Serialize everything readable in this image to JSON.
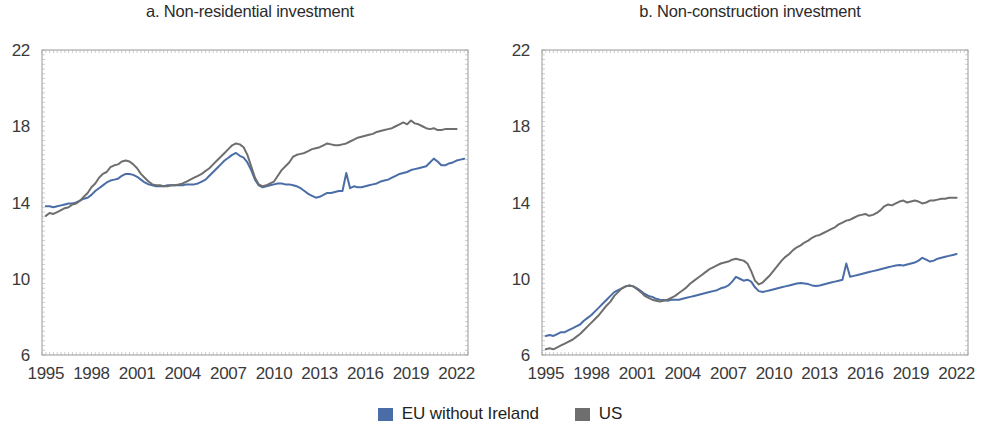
{
  "figure": {
    "background_color": "#ffffff"
  },
  "legend": {
    "position": "bottom-center",
    "entries": [
      {
        "label": "EU without Ireland",
        "color": "#4a6da7",
        "marker": "square"
      },
      {
        "label": "US",
        "color": "#6e6e6e",
        "marker": "square"
      }
    ]
  },
  "chart_data": [
    {
      "type": "line",
      "title": "a. Non-residential investment",
      "xlabel": "",
      "ylabel": "",
      "xlim": [
        1994.75,
        2022.75
      ],
      "ylim": [
        6,
        22
      ],
      "yticks": [
        6,
        10,
        14,
        18,
        22
      ],
      "xticks": [
        1995,
        1998,
        2001,
        2004,
        2007,
        2010,
        2013,
        2016,
        2019,
        2022
      ],
      "grid": false,
      "legend_position": "figure-bottom",
      "series": [
        {
          "name": "EU without Ireland",
          "color": "#4a6da7",
          "x": [
            1995.0,
            1995.25,
            1995.5,
            1995.75,
            1996.0,
            1996.25,
            1996.5,
            1996.75,
            1997.0,
            1997.25,
            1997.5,
            1997.75,
            1998.0,
            1998.25,
            1998.5,
            1998.75,
            1999.0,
            1999.25,
            1999.5,
            1999.75,
            2000.0,
            2000.25,
            2000.5,
            2000.75,
            2001.0,
            2001.25,
            2001.5,
            2001.75,
            2002.0,
            2002.25,
            2002.5,
            2002.75,
            2003.0,
            2003.25,
            2003.5,
            2003.75,
            2004.0,
            2004.25,
            2004.5,
            2004.75,
            2005.0,
            2005.25,
            2005.5,
            2005.75,
            2006.0,
            2006.25,
            2006.5,
            2006.75,
            2007.0,
            2007.25,
            2007.5,
            2007.75,
            2008.0,
            2008.25,
            2008.5,
            2008.75,
            2009.0,
            2009.25,
            2009.5,
            2009.75,
            2010.0,
            2010.25,
            2010.5,
            2010.75,
            2011.0,
            2011.25,
            2011.5,
            2011.75,
            2012.0,
            2012.25,
            2012.5,
            2012.75,
            2013.0,
            2013.25,
            2013.5,
            2013.75,
            2014.0,
            2014.25,
            2014.5,
            2014.75,
            2015.0,
            2015.25,
            2015.5,
            2015.75,
            2016.0,
            2016.25,
            2016.5,
            2016.75,
            2017.0,
            2017.25,
            2017.5,
            2017.75,
            2018.0,
            2018.25,
            2018.5,
            2018.75,
            2019.0,
            2019.25,
            2019.5,
            2019.75,
            2020.0,
            2020.25,
            2020.5,
            2020.75,
            2021.0,
            2021.25,
            2021.5,
            2021.75,
            2022.0,
            2022.25,
            2022.5
          ],
          "y": [
            13.8,
            13.8,
            13.75,
            13.8,
            13.85,
            13.9,
            13.95,
            13.95,
            14.0,
            14.1,
            14.2,
            14.25,
            14.4,
            14.6,
            14.75,
            14.9,
            15.05,
            15.15,
            15.2,
            15.25,
            15.4,
            15.5,
            15.5,
            15.45,
            15.35,
            15.2,
            15.05,
            14.95,
            14.9,
            14.85,
            14.85,
            14.85,
            14.9,
            14.9,
            14.9,
            14.9,
            14.9,
            14.95,
            14.95,
            14.95,
            15.0,
            15.1,
            15.2,
            15.4,
            15.6,
            15.8,
            16.0,
            16.2,
            16.35,
            16.5,
            16.6,
            16.45,
            16.35,
            16.1,
            15.7,
            15.2,
            14.9,
            14.8,
            14.85,
            14.9,
            14.95,
            15.0,
            15.0,
            14.95,
            14.95,
            14.9,
            14.85,
            14.75,
            14.6,
            14.45,
            14.35,
            14.25,
            14.3,
            14.4,
            14.5,
            14.5,
            14.55,
            14.6,
            14.6,
            15.55,
            14.75,
            14.85,
            14.8,
            14.8,
            14.85,
            14.9,
            14.95,
            15.0,
            15.1,
            15.15,
            15.2,
            15.3,
            15.4,
            15.5,
            15.55,
            15.6,
            15.7,
            15.75,
            15.8,
            15.85,
            15.9,
            16.1,
            16.3,
            16.15,
            15.95,
            15.95,
            16.05,
            16.1,
            16.2,
            16.25,
            16.3
          ]
        },
        {
          "name": "US",
          "color": "#6e6e6e",
          "x": [
            1995.0,
            1995.25,
            1995.5,
            1995.75,
            1996.0,
            1996.25,
            1996.5,
            1996.75,
            1997.0,
            1997.25,
            1997.5,
            1997.75,
            1998.0,
            1998.25,
            1998.5,
            1998.75,
            1999.0,
            1999.25,
            1999.5,
            1999.75,
            2000.0,
            2000.25,
            2000.5,
            2000.75,
            2001.0,
            2001.25,
            2001.5,
            2001.75,
            2002.0,
            2002.25,
            2002.5,
            2002.75,
            2003.0,
            2003.25,
            2003.5,
            2003.75,
            2004.0,
            2004.25,
            2004.5,
            2004.75,
            2005.0,
            2005.25,
            2005.5,
            2005.75,
            2006.0,
            2006.25,
            2006.5,
            2006.75,
            2007.0,
            2007.25,
            2007.5,
            2007.75,
            2008.0,
            2008.25,
            2008.5,
            2008.75,
            2009.0,
            2009.25,
            2009.5,
            2009.75,
            2010.0,
            2010.25,
            2010.5,
            2010.75,
            2011.0,
            2011.25,
            2011.5,
            2011.75,
            2012.0,
            2012.25,
            2012.5,
            2012.75,
            2013.0,
            2013.25,
            2013.5,
            2013.75,
            2014.0,
            2014.25,
            2014.5,
            2014.75,
            2015.0,
            2015.25,
            2015.5,
            2015.75,
            2016.0,
            2016.25,
            2016.5,
            2016.75,
            2017.0,
            2017.25,
            2017.5,
            2017.75,
            2018.0,
            2018.25,
            2018.5,
            2018.75,
            2019.0,
            2019.25,
            2019.5,
            2019.75,
            2020.0,
            2020.25,
            2020.5,
            2020.75,
            2021.0,
            2021.25,
            2021.5,
            2021.75,
            2022.0,
            2022.25,
            2022.5
          ],
          "y": [
            13.3,
            13.45,
            13.4,
            13.5,
            13.6,
            13.7,
            13.75,
            13.9,
            13.95,
            14.1,
            14.3,
            14.5,
            14.8,
            15.0,
            15.3,
            15.5,
            15.6,
            15.85,
            15.95,
            16.0,
            16.15,
            16.2,
            16.15,
            16.0,
            15.8,
            15.5,
            15.3,
            15.1,
            14.95,
            14.9,
            14.9,
            14.85,
            14.85,
            14.9,
            14.9,
            14.95,
            15.0,
            15.1,
            15.2,
            15.3,
            15.4,
            15.5,
            15.65,
            15.8,
            16.0,
            16.2,
            16.4,
            16.6,
            16.8,
            17.0,
            17.1,
            17.05,
            16.9,
            16.5,
            15.9,
            15.3,
            14.95,
            14.85,
            14.9,
            15.0,
            15.1,
            15.4,
            15.7,
            15.9,
            16.1,
            16.4,
            16.5,
            16.55,
            16.6,
            16.7,
            16.8,
            16.85,
            16.9,
            17.0,
            17.1,
            17.05,
            17.0,
            17.0,
            17.05,
            17.1,
            17.2,
            17.3,
            17.4,
            17.45,
            17.5,
            17.55,
            17.6,
            17.7,
            17.75,
            17.8,
            17.85,
            17.9,
            18.0,
            18.1,
            18.2,
            18.1,
            18.3,
            18.15,
            18.1,
            18.0,
            17.9,
            17.85,
            17.9,
            17.8,
            17.8,
            17.85,
            17.85,
            17.85,
            17.85
          ]
        }
      ]
    },
    {
      "type": "line",
      "title": "b. Non-construction investment",
      "xlabel": "",
      "ylabel": "",
      "xlim": [
        1994.75,
        2022.75
      ],
      "ylim": [
        6,
        22
      ],
      "yticks": [
        6,
        10,
        14,
        18,
        22
      ],
      "xticks": [
        1995,
        1998,
        2001,
        2004,
        2007,
        2010,
        2013,
        2016,
        2019,
        2022
      ],
      "grid": false,
      "legend_position": "figure-bottom",
      "series": [
        {
          "name": "EU without Ireland",
          "color": "#4a6da7",
          "x": [
            1995.0,
            1995.25,
            1995.5,
            1995.75,
            1996.0,
            1996.25,
            1996.5,
            1996.75,
            1997.0,
            1997.25,
            1997.5,
            1997.75,
            1998.0,
            1998.25,
            1998.5,
            1998.75,
            1999.0,
            1999.25,
            1999.5,
            1999.75,
            2000.0,
            2000.25,
            2000.5,
            2000.75,
            2001.0,
            2001.25,
            2001.5,
            2001.75,
            2002.0,
            2002.25,
            2002.5,
            2002.75,
            2003.0,
            2003.25,
            2003.5,
            2003.75,
            2004.0,
            2004.25,
            2004.5,
            2004.75,
            2005.0,
            2005.25,
            2005.5,
            2005.75,
            2006.0,
            2006.25,
            2006.5,
            2006.75,
            2007.0,
            2007.25,
            2007.5,
            2007.75,
            2008.0,
            2008.25,
            2008.5,
            2008.75,
            2009.0,
            2009.25,
            2009.5,
            2009.75,
            2010.0,
            2010.25,
            2010.5,
            2010.75,
            2011.0,
            2011.25,
            2011.5,
            2011.75,
            2012.0,
            2012.25,
            2012.5,
            2012.75,
            2013.0,
            2013.25,
            2013.5,
            2013.75,
            2014.0,
            2014.25,
            2014.5,
            2014.75,
            2015.0,
            2015.25,
            2015.5,
            2015.75,
            2016.0,
            2016.25,
            2016.5,
            2016.75,
            2017.0,
            2017.25,
            2017.5,
            2017.75,
            2018.0,
            2018.25,
            2018.5,
            2018.75,
            2019.0,
            2019.25,
            2019.5,
            2019.75,
            2020.0,
            2020.25,
            2020.5,
            2020.75,
            2021.0,
            2021.25,
            2021.5,
            2021.75,
            2022.0,
            2022.25,
            2022.5
          ],
          "y": [
            7.0,
            7.05,
            7.0,
            7.1,
            7.2,
            7.2,
            7.3,
            7.4,
            7.5,
            7.6,
            7.8,
            7.95,
            8.1,
            8.3,
            8.5,
            8.7,
            8.9,
            9.1,
            9.3,
            9.4,
            9.5,
            9.6,
            9.65,
            9.6,
            9.5,
            9.35,
            9.2,
            9.1,
            9.05,
            8.95,
            8.9,
            8.88,
            8.85,
            8.9,
            8.9,
            8.9,
            8.95,
            9.0,
            9.05,
            9.1,
            9.15,
            9.2,
            9.25,
            9.3,
            9.35,
            9.4,
            9.5,
            9.55,
            9.65,
            9.85,
            10.1,
            10.0,
            9.9,
            9.95,
            9.85,
            9.55,
            9.35,
            9.3,
            9.35,
            9.4,
            9.45,
            9.5,
            9.55,
            9.6,
            9.65,
            9.7,
            9.75,
            9.78,
            9.75,
            9.72,
            9.65,
            9.62,
            9.65,
            9.7,
            9.75,
            9.8,
            9.85,
            9.9,
            9.95,
            10.8,
            10.1,
            10.15,
            10.2,
            10.25,
            10.3,
            10.35,
            10.4,
            10.45,
            10.5,
            10.55,
            10.6,
            10.65,
            10.7,
            10.72,
            10.7,
            10.75,
            10.8,
            10.85,
            10.95,
            11.1,
            11.0,
            10.9,
            10.95,
            11.05,
            11.1,
            11.15,
            11.2,
            11.25,
            11.3
          ]
        },
        {
          "name": "US",
          "color": "#6e6e6e",
          "x": [
            1995.0,
            1995.25,
            1995.5,
            1995.75,
            1996.0,
            1996.25,
            1996.5,
            1996.75,
            1997.0,
            1997.25,
            1997.5,
            1997.75,
            1998.0,
            1998.25,
            1998.5,
            1998.75,
            1999.0,
            1999.25,
            1999.5,
            1999.75,
            2000.0,
            2000.25,
            2000.5,
            2000.75,
            2001.0,
            2001.25,
            2001.5,
            2001.75,
            2002.0,
            2002.25,
            2002.5,
            2002.75,
            2003.0,
            2003.25,
            2003.5,
            2003.75,
            2004.0,
            2004.25,
            2004.5,
            2004.75,
            2005.0,
            2005.25,
            2005.5,
            2005.75,
            2006.0,
            2006.25,
            2006.5,
            2006.75,
            2007.0,
            2007.25,
            2007.5,
            2007.75,
            2008.0,
            2008.25,
            2008.5,
            2008.75,
            2009.0,
            2009.25,
            2009.5,
            2009.75,
            2010.0,
            2010.25,
            2010.5,
            2010.75,
            2011.0,
            2011.25,
            2011.5,
            2011.75,
            2012.0,
            2012.25,
            2012.5,
            2012.75,
            2013.0,
            2013.25,
            2013.5,
            2013.75,
            2014.0,
            2014.25,
            2014.5,
            2014.75,
            2015.0,
            2015.25,
            2015.5,
            2015.75,
            2016.0,
            2016.25,
            2016.5,
            2016.75,
            2017.0,
            2017.25,
            2017.5,
            2017.75,
            2018.0,
            2018.25,
            2018.5,
            2018.75,
            2019.0,
            2019.25,
            2019.5,
            2019.75,
            2020.0,
            2020.25,
            2020.5,
            2020.75,
            2021.0,
            2021.25,
            2021.5,
            2021.75,
            2022.0,
            2022.25,
            2022.5
          ],
          "y": [
            6.3,
            6.35,
            6.3,
            6.4,
            6.5,
            6.6,
            6.7,
            6.8,
            6.95,
            7.1,
            7.3,
            7.5,
            7.7,
            7.9,
            8.1,
            8.35,
            8.6,
            8.8,
            9.1,
            9.3,
            9.5,
            9.6,
            9.65,
            9.6,
            9.45,
            9.3,
            9.1,
            9.0,
            8.9,
            8.85,
            8.8,
            8.85,
            8.9,
            9.0,
            9.1,
            9.25,
            9.4,
            9.55,
            9.75,
            9.9,
            10.05,
            10.2,
            10.35,
            10.5,
            10.6,
            10.7,
            10.8,
            10.85,
            10.9,
            11.0,
            11.05,
            11.0,
            10.95,
            10.8,
            10.4,
            9.9,
            9.7,
            9.8,
            10.0,
            10.2,
            10.45,
            10.7,
            10.95,
            11.15,
            11.3,
            11.5,
            11.65,
            11.75,
            11.9,
            12.0,
            12.15,
            12.25,
            12.3,
            12.4,
            12.5,
            12.6,
            12.7,
            12.85,
            12.95,
            13.05,
            13.1,
            13.2,
            13.3,
            13.35,
            13.4,
            13.3,
            13.35,
            13.45,
            13.6,
            13.8,
            13.9,
            13.85,
            13.95,
            14.05,
            14.1,
            14.0,
            14.05,
            14.1,
            14.05,
            13.95,
            14.0,
            14.1,
            14.1,
            14.15,
            14.2,
            14.2,
            14.25,
            14.25,
            14.25
          ]
        }
      ]
    }
  ]
}
